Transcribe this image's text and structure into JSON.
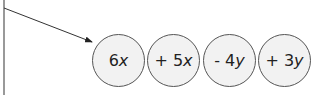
{
  "diagram": {
    "terms": [
      {
        "coef": "6",
        "var": "x"
      },
      {
        "coef": "+ 5",
        "var": "x"
      },
      {
        "coef": "- 4",
        "var": "y"
      },
      {
        "coef": "+ 3",
        "var": "y"
      }
    ],
    "colors": {
      "circle_fill": "#f2f2f2",
      "circle_stroke": "#555555",
      "line": "#333333",
      "text": "#222222"
    }
  }
}
